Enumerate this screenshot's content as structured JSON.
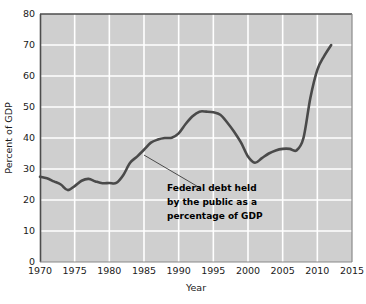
{
  "chart_data": {
    "type": "line",
    "title": "",
    "subtitle": "",
    "xlabel": "Year",
    "ylabel": "Percent of GDP",
    "xlim": [
      1970,
      2015
    ],
    "ylim": [
      0,
      80
    ],
    "xticks": [
      "1970",
      "1975",
      "1980",
      "1985",
      "1990",
      "1995",
      "2000",
      "2005",
      "2010",
      "2015"
    ],
    "yticks": [
      "0",
      "10",
      "20",
      "30",
      "40",
      "50",
      "60",
      "70",
      "80"
    ],
    "grid": true,
    "legend": "none",
    "plot_background": "#cfcfcf",
    "gridline_color": "#ffffff",
    "line_color": "#4a4a4a",
    "series": [
      {
        "name": "Federal debt held by the public as a percentage of GDP",
        "x": [
          1970,
          1971,
          1972,
          1973,
          1974,
          1975,
          1976,
          1977,
          1978,
          1979,
          1980,
          1981,
          1982,
          1983,
          1984,
          1985,
          1986,
          1987,
          1988,
          1989,
          1990,
          1991,
          1992,
          1993,
          1994,
          1995,
          1996,
          1997,
          1998,
          1999,
          2000,
          2001,
          2002,
          2003,
          2004,
          2005,
          2006,
          2007,
          2008,
          2009,
          2010,
          2011,
          2012
        ],
        "values": [
          27.5,
          27.0,
          26.0,
          25.0,
          23.2,
          24.5,
          26.2,
          26.8,
          26.0,
          25.4,
          25.5,
          25.5,
          28.0,
          32.0,
          34.0,
          36.2,
          38.5,
          39.5,
          40.0,
          40.1,
          41.5,
          44.5,
          47.0,
          48.5,
          48.5,
          48.3,
          47.5,
          45.0,
          42.0,
          38.5,
          34.0,
          32.0,
          33.5,
          35.0,
          36.0,
          36.5,
          36.5,
          36.0,
          40.0,
          53.0,
          62.0,
          66.5,
          70.0
        ]
      }
    ],
    "annotations": [
      {
        "lines": [
          "Federal debt held",
          "by the public as a",
          "percentage of GDP"
        ],
        "leader_from": {
          "x": 1985,
          "y": 34.5
        },
        "leader_to": {
          "x": 1993,
          "y": 24.0
        }
      }
    ]
  },
  "figure": {
    "axis_title_x": "Year",
    "axis_title_y": "Percent of GDP"
  }
}
